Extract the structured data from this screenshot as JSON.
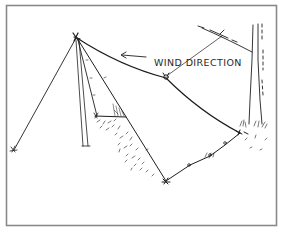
{
  "figure": {
    "label": "WIND DIRECTION",
    "colors": {
      "ink": "#1e1e1e",
      "frame": "#8a8a8a",
      "background": "#ffffff"
    },
    "elements": [
      "frame",
      "pole",
      "guy-line",
      "tarp",
      "ridge-line",
      "tree",
      "wind-arrow",
      "wind-direction-label",
      "stakes",
      "ground-hatching"
    ]
  }
}
